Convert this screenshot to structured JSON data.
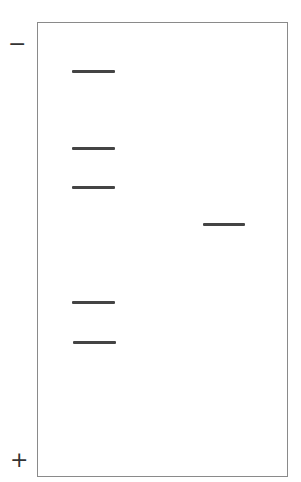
{
  "gel": {
    "negative_label": "−",
    "positive_label": "+",
    "lanes": [
      {
        "name": "lane-1",
        "bands": [
          {
            "x": 72,
            "y": 70,
            "w": 43
          },
          {
            "x": 72,
            "y": 147,
            "w": 43
          },
          {
            "x": 72,
            "y": 186,
            "w": 43
          },
          {
            "x": 72,
            "y": 301,
            "w": 43
          },
          {
            "x": 73,
            "y": 341,
            "w": 43
          }
        ]
      },
      {
        "name": "lane-2",
        "bands": [
          {
            "x": 203,
            "y": 223,
            "w": 42
          }
        ]
      }
    ],
    "band_color": "#444444"
  }
}
